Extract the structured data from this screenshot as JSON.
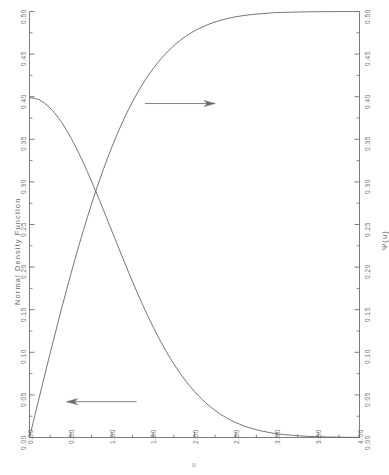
{
  "chart_data": {
    "type": "line",
    "title": "",
    "subtitle": "",
    "xlabel": "u",
    "ylabel": "Normal Density Function",
    "y2label": "Ψ(u)",
    "xlim": [
      0.0,
      4.0
    ],
    "ylim": [
      0.0,
      0.5
    ],
    "y2lim": [
      0.0,
      0.5
    ],
    "grid": false,
    "legend": null,
    "xticks": [
      0.0,
      0.5,
      1.0,
      1.5,
      2.0,
      2.5,
      3.0,
      3.5,
      4.0
    ],
    "xticklabels": [
      "0.00",
      "0.50",
      "1.00",
      "1.50",
      "2.00",
      "2.50",
      "3.00",
      "3.50",
      "4.00"
    ],
    "xminorticks": [
      0.25,
      0.75,
      1.25,
      1.75,
      2.25,
      2.75,
      3.25,
      3.75
    ],
    "yticks": [
      0.0,
      0.05,
      0.1,
      0.15,
      0.2,
      0.25,
      0.3,
      0.35,
      0.4,
      0.45,
      0.5
    ],
    "yticklabels": [
      "0.00",
      "0.05",
      "0.10",
      "0.15",
      "0.20",
      "0.25",
      "0.30",
      "0.35",
      "0.40",
      "0.45",
      "0.50"
    ],
    "y2ticks": [
      0.0,
      0.05,
      0.1,
      0.15,
      0.2,
      0.25,
      0.3,
      0.35,
      0.4,
      0.45,
      0.5
    ],
    "y2ticklabels": [
      "0.00",
      "0.05",
      "0.10",
      "0.15",
      "0.20",
      "0.25",
      "0.30",
      "0.35",
      "0.40",
      "0.45",
      "0.50"
    ],
    "series": [
      {
        "name": "Normal Density Function",
        "axis": "left",
        "x": [
          0.0,
          0.1,
          0.2,
          0.3,
          0.4,
          0.5,
          0.6,
          0.7,
          0.8,
          0.9,
          1.0,
          1.1,
          1.2,
          1.3,
          1.4,
          1.5,
          1.6,
          1.7,
          1.8,
          1.9,
          2.0,
          2.1,
          2.2,
          2.3,
          2.4,
          2.5,
          2.6,
          2.7,
          2.8,
          2.9,
          3.0,
          3.2,
          3.4,
          3.6,
          3.8,
          4.0
        ],
        "values": [
          0.3989,
          0.397,
          0.391,
          0.3814,
          0.3683,
          0.3521,
          0.3332,
          0.3123,
          0.2897,
          0.2661,
          0.242,
          0.2179,
          0.1942,
          0.1714,
          0.1497,
          0.1295,
          0.1109,
          0.094,
          0.079,
          0.0656,
          0.054,
          0.044,
          0.0355,
          0.0283,
          0.0224,
          0.0175,
          0.0136,
          0.0104,
          0.0079,
          0.006,
          0.0044,
          0.0024,
          0.0012,
          0.0006,
          0.0003,
          0.0001
        ]
      },
      {
        "name": "Ψ(u)",
        "axis": "right",
        "x": [
          0.0,
          0.1,
          0.2,
          0.3,
          0.4,
          0.5,
          0.6,
          0.7,
          0.8,
          0.9,
          1.0,
          1.1,
          1.2,
          1.3,
          1.4,
          1.5,
          1.6,
          1.7,
          1.8,
          1.9,
          2.0,
          2.1,
          2.2,
          2.3,
          2.4,
          2.5,
          2.6,
          2.7,
          2.8,
          2.9,
          3.0,
          3.2,
          3.4,
          3.6,
          3.8,
          4.0
        ],
        "values": [
          0.0,
          0.0398,
          0.0793,
          0.1179,
          0.1554,
          0.1915,
          0.2257,
          0.258,
          0.2881,
          0.3159,
          0.3413,
          0.3643,
          0.3849,
          0.4032,
          0.4192,
          0.4332,
          0.4452,
          0.4554,
          0.4641,
          0.4713,
          0.4772,
          0.4821,
          0.4861,
          0.4893,
          0.4918,
          0.4938,
          0.4953,
          0.4965,
          0.4974,
          0.4981,
          0.4987,
          0.4993,
          0.4997,
          0.4998,
          0.4999,
          0.5
        ]
      }
    ],
    "annotations": [
      {
        "name": "density-arrow",
        "label": "",
        "direction": "left",
        "x_data": 1.3,
        "y_data": 0.042,
        "length_data": 0.85
      },
      {
        "name": "psi-arrow",
        "label": "",
        "direction": "right",
        "x_data": 1.4,
        "y_data": 0.392,
        "length_data": 0.85
      }
    ]
  },
  "axes": {
    "left_title": "Normal Density Function",
    "right_title": "Ψ(u)",
    "bottom_title": "u"
  }
}
